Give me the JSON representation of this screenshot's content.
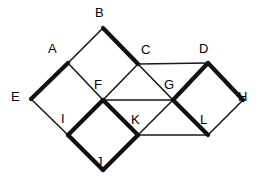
{
  "figure": {
    "canvas": {
      "width": 263,
      "height": 184
    },
    "stroke_colors": {
      "thin": "#1a1a1a",
      "thick": "#111111",
      "background": "#ffffff",
      "label": "#000000"
    },
    "stroke_widths": {
      "thin": 1.6,
      "thick": 4.2
    },
    "vertices": [
      {
        "id": "A",
        "label": "A",
        "x": 68,
        "y": 63,
        "label_x": 48,
        "label_y": 42
      },
      {
        "id": "B",
        "label": "B",
        "x": 103,
        "y": 28,
        "label_x": 95,
        "label_y": 6
      },
      {
        "id": "C",
        "label": "C",
        "x": 138,
        "y": 64,
        "label_x": 141,
        "label_y": 43
      },
      {
        "id": "D",
        "label": "D",
        "x": 208,
        "y": 63,
        "label_x": 199,
        "label_y": 42
      },
      {
        "id": "E",
        "label": "E",
        "x": 31,
        "y": 99,
        "label_x": 11,
        "label_y": 90
      },
      {
        "id": "F",
        "label": "F",
        "x": 103,
        "y": 100,
        "label_x": 94,
        "label_y": 78
      },
      {
        "id": "G",
        "label": "G",
        "x": 173,
        "y": 100,
        "label_x": 164,
        "label_y": 78
      },
      {
        "id": "H",
        "label": "H",
        "x": 243,
        "y": 100,
        "label_x": 238,
        "label_y": 90
      },
      {
        "id": "I",
        "label": "I",
        "x": 68,
        "y": 135,
        "label_x": 61,
        "label_y": 112
      },
      {
        "id": "J",
        "label": "J",
        "x": 103,
        "y": 170,
        "label_x": 96,
        "label_y": 155
      },
      {
        "id": "K",
        "label": "K",
        "x": 138,
        "y": 135,
        "label_x": 131,
        "label_y": 113
      },
      {
        "id": "L",
        "label": "L",
        "x": 208,
        "y": 135,
        "label_x": 200,
        "label_y": 113
      }
    ],
    "edges": [
      {
        "from": "A",
        "to": "B",
        "weight": "thin"
      },
      {
        "from": "B",
        "to": "C",
        "weight": "thick"
      },
      {
        "from": "A",
        "to": "F",
        "weight": "thin"
      },
      {
        "from": "F",
        "to": "C",
        "weight": "thin"
      },
      {
        "from": "A",
        "to": "E",
        "weight": "thick"
      },
      {
        "from": "E",
        "to": "I",
        "weight": "thin"
      },
      {
        "from": "I",
        "to": "F",
        "weight": "thick"
      },
      {
        "from": "C",
        "to": "D",
        "weight": "thin"
      },
      {
        "from": "C",
        "to": "G",
        "weight": "thin"
      },
      {
        "from": "F",
        "to": "G",
        "weight": "thin"
      },
      {
        "from": "D",
        "to": "G",
        "weight": "thick"
      },
      {
        "from": "D",
        "to": "H",
        "weight": "thick"
      },
      {
        "from": "H",
        "to": "L",
        "weight": "thin"
      },
      {
        "from": "G",
        "to": "L",
        "weight": "thick"
      },
      {
        "from": "F",
        "to": "K",
        "weight": "thick"
      },
      {
        "from": "G",
        "to": "K",
        "weight": "thin"
      },
      {
        "from": "I",
        "to": "J",
        "weight": "thick"
      },
      {
        "from": "J",
        "to": "K",
        "weight": "thick"
      },
      {
        "from": "K",
        "to": "L",
        "weight": "thin"
      }
    ]
  }
}
